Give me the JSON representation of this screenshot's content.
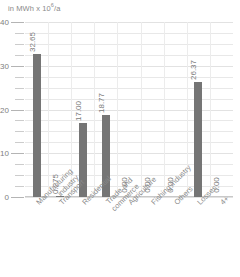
{
  "chart_data": {
    "type": "bar",
    "title": "",
    "subtitle": "",
    "unit_label": "in MWh x 10",
    "unit_exponent": "6",
    "unit_suffix": "/a",
    "xlabel": "",
    "ylabel": "in MWh x 10⁶/a",
    "ylim": [
      0,
      40
    ],
    "grid": true,
    "legend": "none",
    "y_ticks": [
      "40",
      "30",
      "20",
      "10",
      "0"
    ],
    "y_tick_values": [
      40,
      30,
      20,
      10,
      0
    ],
    "y_minor_step": 2.5,
    "bar_color": "#757575",
    "gridline_color": "#e8e8e8",
    "axis_color": "#b4b4b4",
    "text_color": "#808080",
    "categories": [
      "Manufacturing industry",
      "Transport",
      "Residential",
      "Trade and commerce",
      "Agriculture",
      "Fishing industry",
      "Others",
      "Losses",
      "4+"
    ],
    "category_lines": [
      [
        "Manufacturing",
        "industry"
      ],
      [
        "Transport"
      ],
      [
        "Residential"
      ],
      [
        "Trade and",
        "commerce"
      ],
      [
        "Agriculture"
      ],
      [
        "Fishing industry"
      ],
      [
        "Others"
      ],
      [
        "Losses"
      ],
      [
        "4+"
      ]
    ],
    "values": [
      32.65,
      0.275,
      17.0,
      18.77,
      0.0,
      0.0,
      0.0,
      26.37,
      0.0
    ],
    "value_labels": [
      "32.65",
      "0.275",
      "17.00",
      "18.77",
      "0.00",
      "0.00",
      "0.00",
      "26.37",
      "0.00"
    ]
  }
}
